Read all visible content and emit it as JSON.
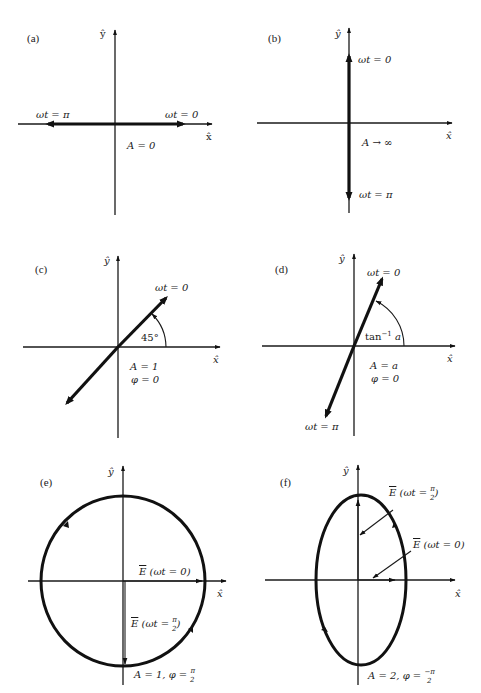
{
  "figure": {
    "axis_labels": {
      "x": "x̂",
      "y": "ŷ"
    },
    "panels": [
      {
        "id": "a",
        "label": "(a)",
        "type": "linear polarization (horizontal)",
        "annotations": {
          "wt0": "ωt = 0",
          "wtpi": "ωt = π",
          "param": "A = 0"
        }
      },
      {
        "id": "b",
        "label": "(b)",
        "type": "linear polarization (vertical)",
        "annotations": {
          "wt0": "ωt = 0",
          "wtpi": "ωt = π",
          "param": "A → ∞"
        }
      },
      {
        "id": "c",
        "label": "(c)",
        "type": "linear polarization at 45°",
        "annotations": {
          "wt0": "ωt = 0",
          "angle": "45°",
          "param1": "A = 1",
          "param2": "φ = 0"
        }
      },
      {
        "id": "d",
        "label": "(d)",
        "type": "linear polarization at angle tan⁻¹ a",
        "annotations": {
          "wt0": "ωt = 0",
          "wtpi": "ωt = π",
          "angle_base": "tan",
          "angle_sup": "−1",
          "angle_arg": " a",
          "param1": "A = a",
          "param2": "φ = 0"
        }
      },
      {
        "id": "e",
        "label": "(e)",
        "type": "circular polarization",
        "annotations": {
          "E0_pre": "E",
          "E0_post": " (ωt = 0)",
          "E90_pre": "E",
          "E90_mid": " (ωt = ",
          "E90_num": "π",
          "E90_den": "2",
          "E90_post": ")",
          "param_pre": "A = 1, φ = ",
          "param_num": "π",
          "param_den": "2"
        }
      },
      {
        "id": "f",
        "label": "(f)",
        "type": "elliptical polarization",
        "annotations": {
          "E90_pre": "E",
          "E90_mid": " (ωt = ",
          "E90_num": "π",
          "E90_den": "2",
          "E90_post": ")",
          "E0_pre": "E",
          "E0_post": " (ωt = 0)",
          "param_pre": "A = 2, φ = ",
          "param_num": "−π",
          "param_den": "2"
        }
      }
    ]
  }
}
